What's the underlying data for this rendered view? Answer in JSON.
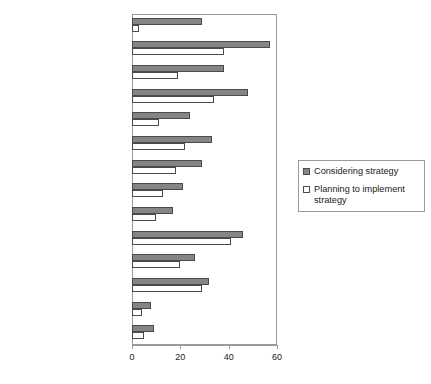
{
  "caption": {
    "text": ""
  },
  "legend": {
    "position": "right",
    "items": [
      {
        "label": "Considering strategy",
        "swatch": "considering",
        "color": "#858585"
      },
      {
        "label": "Planning to implement strategy",
        "swatch": "planning",
        "color": "#ffffff"
      }
    ]
  },
  "axis": {
    "x_ticks": [
      "0",
      "20",
      "40",
      "60"
    ]
  },
  "chart_data": {
    "type": "bar",
    "orientation": "horizontal",
    "title": "",
    "xlabel": "",
    "ylabel": "",
    "xlim": [
      0,
      60
    ],
    "xticks": [
      0,
      20,
      40,
      60
    ],
    "grid": false,
    "legend_position": "right",
    "categories": [
      "External softw are development",
      "Consortia or shared purchases",
      "Shared technology implementation",
      "Minimize supported technologies",
      "Salary freezes",
      "Use open source",
      "Cuts in service levels",
      "Outsourcing",
      "Layoffs",
      "Across-the-board cuts",
      "Limit duplicate IT organizations",
      "Cut renew al and replacement",
      "Cut benefits",
      "Other"
    ],
    "series": [
      {
        "name": "Considering strategy",
        "color": "#858585",
        "values": [
          29,
          57,
          38,
          48,
          24,
          33,
          29,
          21,
          17,
          46,
          26,
          32,
          8,
          9
        ]
      },
      {
        "name": "Planning to implement strategy",
        "color": "#ffffff",
        "values": [
          3,
          38,
          19,
          34,
          11,
          22,
          18,
          13,
          10,
          41,
          20,
          29,
          4,
          5
        ]
      }
    ]
  }
}
